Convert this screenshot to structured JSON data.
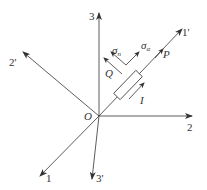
{
  "diagram": {
    "type": "coordinate-axes-stress-element",
    "origin": {
      "label": "O",
      "x": 99,
      "y": 116
    },
    "axes": [
      {
        "id": "axis-3",
        "label": "3",
        "end": [
          99,
          12
        ]
      },
      {
        "id": "axis-1prime",
        "label": "1'",
        "end": [
          183,
          28
        ]
      },
      {
        "id": "axis-2",
        "label": "2",
        "end": [
          193,
          116
        ]
      },
      {
        "id": "axis-2prime",
        "label": "2'",
        "end": [
          22,
          52
        ]
      },
      {
        "id": "axis-1",
        "label": "1",
        "end": [
          39,
          177
        ]
      },
      {
        "id": "axis-3prime",
        "label": "3'",
        "end": [
          92,
          180
        ]
      }
    ],
    "labels": {
      "origin": "O",
      "axis_3": "3",
      "axis_1prime": "1'",
      "axis_2": "2",
      "axis_2prime": "2'",
      "axis_1": "1",
      "axis_3prime": "3'",
      "P": "P",
      "Q": "Q",
      "I": "I",
      "sigma": "σ",
      "sigma_n_sub": "n",
      "sigma_alpha_sub": "α"
    },
    "colors": {
      "line": "#333333",
      "background": "#ffffff"
    }
  }
}
